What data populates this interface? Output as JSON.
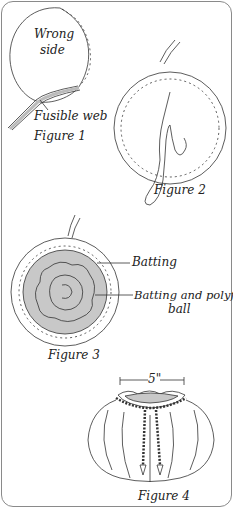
{
  "figure1": {
    "caption": "Figure 1",
    "labels": {
      "wrong_side_line1": "Wrong",
      "wrong_side_line2": "side",
      "fusible_web": "Fusible web"
    }
  },
  "figure2": {
    "caption": "Figure 2"
  },
  "figure3": {
    "caption": "Figure 3",
    "labels": {
      "batting": "Batting",
      "batting_polyfil_line1": "Batting and polyfil",
      "batting_polyfil_line2": "ball"
    }
  },
  "figure4": {
    "caption": "Figure 4",
    "dimension": "5\""
  },
  "colors": {
    "line": "#333333",
    "fill_gray": "#c8c8c8",
    "border": "#8a8a8a"
  }
}
